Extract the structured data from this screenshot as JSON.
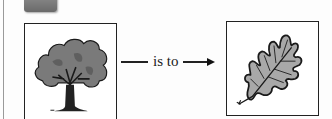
{
  "analogy": {
    "left_image": "tree",
    "relation_label": "is to",
    "right_image": "oak-leaf"
  },
  "colors": {
    "frame": "#222222",
    "foliage": "#7a7a7a",
    "leaf_fill": "#a8a8a8",
    "tab": "#777777"
  }
}
